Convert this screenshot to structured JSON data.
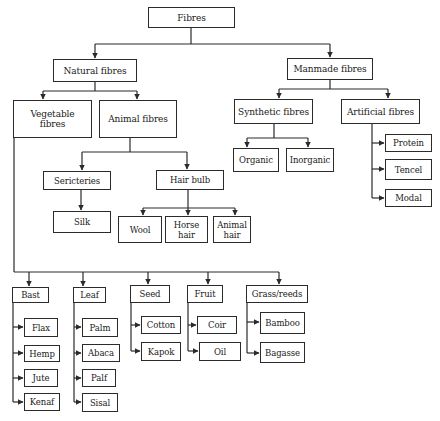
{
  "diagram": {
    "type": "hierarchy",
    "root": "Fibres",
    "line_color": "#2b2b2b",
    "nodes": {
      "fibres": {
        "label": "Fibres",
        "x": 148,
        "y": 7,
        "w": 87,
        "h": 21
      },
      "natural": {
        "label": "Natural fibres",
        "x": 53,
        "y": 59,
        "w": 84,
        "h": 23
      },
      "manmade": {
        "label": "Manmade fibres",
        "x": 287,
        "y": 58,
        "w": 86,
        "h": 22
      },
      "vegetable": {
        "label": "Vegetable\nfibres",
        "x": 13,
        "y": 100,
        "w": 79,
        "h": 38
      },
      "animal": {
        "label": "Animal fibres",
        "x": 99,
        "y": 100,
        "w": 78,
        "h": 38
      },
      "synthetic": {
        "label": "Synthetic fibres",
        "x": 234,
        "y": 99,
        "w": 79,
        "h": 25
      },
      "artificial": {
        "label": "Artificial fibres",
        "x": 341,
        "y": 99,
        "w": 79,
        "h": 25
      },
      "organic": {
        "label": "Organic",
        "x": 233,
        "y": 148,
        "w": 46,
        "h": 24
      },
      "inorganic": {
        "label": "Inorganic",
        "x": 286,
        "y": 148,
        "w": 48,
        "h": 24
      },
      "protein": {
        "label": "Protein",
        "x": 385,
        "y": 134,
        "w": 47,
        "h": 18
      },
      "tencel": {
        "label": "Tencel",
        "x": 385,
        "y": 159,
        "w": 47,
        "h": 21
      },
      "modal": {
        "label": "Modal",
        "x": 385,
        "y": 189,
        "w": 47,
        "h": 18
      },
      "sericteries": {
        "label": "Sericteries",
        "x": 43,
        "y": 171,
        "w": 68,
        "h": 19
      },
      "hairbulb": {
        "label": "Hair bulb",
        "x": 156,
        "y": 170,
        "w": 68,
        "h": 20
      },
      "silk": {
        "label": "Silk",
        "x": 53,
        "y": 211,
        "w": 58,
        "h": 22
      },
      "wool": {
        "label": "Wool",
        "x": 118,
        "y": 216,
        "w": 44,
        "h": 27
      },
      "horsehair": {
        "label": "Horse\nhair",
        "x": 165,
        "y": 216,
        "w": 43,
        "h": 27
      },
      "animalhair": {
        "label": "Animal\nhair",
        "x": 213,
        "y": 216,
        "w": 38,
        "h": 27
      },
      "bast": {
        "label": "Bast",
        "x": 12,
        "y": 287,
        "w": 37,
        "h": 16
      },
      "leaf": {
        "label": "Leaf",
        "x": 73,
        "y": 287,
        "w": 33,
        "h": 16
      },
      "seed": {
        "label": "Seed",
        "x": 130,
        "y": 285,
        "w": 40,
        "h": 18
      },
      "fruit": {
        "label": "Fruit",
        "x": 187,
        "y": 285,
        "w": 36,
        "h": 18
      },
      "grass": {
        "label": "Grass/reeds",
        "x": 246,
        "y": 285,
        "w": 62,
        "h": 18
      },
      "flax": {
        "label": "Flax",
        "x": 24,
        "y": 318,
        "w": 34,
        "h": 19
      },
      "hemp": {
        "label": "Hemp",
        "x": 24,
        "y": 345,
        "w": 36,
        "h": 17
      },
      "jute": {
        "label": "Jute",
        "x": 24,
        "y": 369,
        "w": 34,
        "h": 18
      },
      "kenaf": {
        "label": "Kenaf",
        "x": 24,
        "y": 393,
        "w": 36,
        "h": 18
      },
      "palm": {
        "label": "Palm",
        "x": 82,
        "y": 318,
        "w": 36,
        "h": 19
      },
      "abaca": {
        "label": "Abaca",
        "x": 82,
        "y": 344,
        "w": 38,
        "h": 18
      },
      "palf": {
        "label": "Palf",
        "x": 82,
        "y": 369,
        "w": 34,
        "h": 18
      },
      "sisal": {
        "label": "Sisal",
        "x": 82,
        "y": 393,
        "w": 36,
        "h": 19
      },
      "cotton": {
        "label": "Cotton",
        "x": 141,
        "y": 316,
        "w": 40,
        "h": 18
      },
      "kapok": {
        "label": "Kapok",
        "x": 141,
        "y": 342,
        "w": 40,
        "h": 19
      },
      "coir": {
        "label": "Coir",
        "x": 197,
        "y": 316,
        "w": 40,
        "h": 18
      },
      "oil": {
        "label": "Oil",
        "x": 199,
        "y": 342,
        "w": 42,
        "h": 19
      },
      "bamboo": {
        "label": "Bamboo",
        "x": 260,
        "y": 312,
        "w": 45,
        "h": 22
      },
      "bagasse": {
        "label": "Bagasse",
        "x": 260,
        "y": 342,
        "w": 45,
        "h": 21
      }
    },
    "edges": [
      [
        "fibres",
        "natural"
      ],
      [
        "fibres",
        "manmade"
      ],
      [
        "natural",
        "vegetable"
      ],
      [
        "natural",
        "animal"
      ],
      [
        "manmade",
        "synthetic"
      ],
      [
        "manmade",
        "artificial"
      ],
      [
        "synthetic",
        "organic"
      ],
      [
        "synthetic",
        "inorganic"
      ],
      [
        "artificial",
        "protein"
      ],
      [
        "artificial",
        "tencel"
      ],
      [
        "artificial",
        "modal"
      ],
      [
        "animal",
        "sericteries"
      ],
      [
        "animal",
        "hairbulb"
      ],
      [
        "sericteries",
        "silk"
      ],
      [
        "hairbulb",
        "wool"
      ],
      [
        "hairbulb",
        "horsehair"
      ],
      [
        "hairbulb",
        "animalhair"
      ],
      [
        "vegetable",
        "bast"
      ],
      [
        "vegetable",
        "leaf"
      ],
      [
        "vegetable",
        "seed"
      ],
      [
        "vegetable",
        "fruit"
      ],
      [
        "vegetable",
        "grass"
      ],
      [
        "bast",
        "flax"
      ],
      [
        "bast",
        "hemp"
      ],
      [
        "bast",
        "jute"
      ],
      [
        "bast",
        "kenaf"
      ],
      [
        "leaf",
        "palm"
      ],
      [
        "leaf",
        "abaca"
      ],
      [
        "leaf",
        "palf"
      ],
      [
        "leaf",
        "sisal"
      ],
      [
        "seed",
        "cotton"
      ],
      [
        "seed",
        "kapok"
      ],
      [
        "fruit",
        "coir"
      ],
      [
        "fruit",
        "oil"
      ],
      [
        "grass",
        "bamboo"
      ],
      [
        "grass",
        "bagasse"
      ]
    ]
  }
}
